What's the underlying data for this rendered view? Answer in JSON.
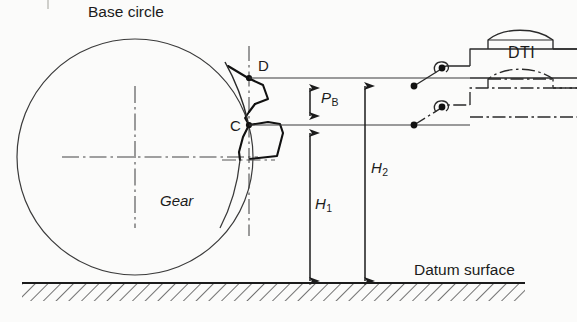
{
  "figure": {
    "kind": "engineering-diagram",
    "labels": {
      "base_circle": "Base circle",
      "gear": "Gear",
      "datum_surface": "Datum surface",
      "dti": "DTI",
      "point_upper": "D",
      "point_lower": "C",
      "base_pitch_symbol": "P",
      "base_pitch_subscript": "B",
      "height1_symbol": "H",
      "height1_subscript": "1",
      "height2_symbol": "H",
      "height2_subscript": "2"
    },
    "colors": {
      "ink": "#1b1b1b",
      "thin_line": "#3a3a3a",
      "paper": "#fbfbfa",
      "hatch": "#2a2a2a"
    },
    "geometry": {
      "base_circle_center": [
        135,
        157
      ],
      "base_circle_radius": 118,
      "point_D": [
        249,
        78
      ],
      "point_C": [
        249,
        125
      ],
      "datum_line_y": 283,
      "h1_arrow_x": 310,
      "h2_arrow_x": 365,
      "dti_upper_tip": [
        414,
        86
      ],
      "dti_lower_tip": [
        414,
        125
      ]
    },
    "dimensions": {
      "base_pitch_from": "C",
      "base_pitch_to": "D",
      "height1_from": "datum surface",
      "height1_to": "C",
      "height2_from": "datum surface",
      "height2_to": "D"
    }
  }
}
